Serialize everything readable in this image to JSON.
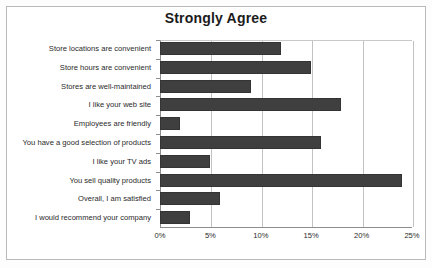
{
  "chart_data": {
    "type": "bar",
    "orientation": "horizontal",
    "title": "Strongly Agree",
    "xlabel": "",
    "ylabel": "",
    "xlim": [
      0,
      25
    ],
    "grid": true,
    "legend": false,
    "value_suffix": "%",
    "xticks": [
      "0%",
      "5%",
      "10%",
      "15%",
      "20%",
      "25%"
    ],
    "xtick_values": [
      0,
      5,
      10,
      15,
      20,
      25
    ],
    "categories": [
      "Store locations are convenient",
      "Store hours are convenient",
      "Stores are well-maintained",
      "I like your web site",
      "Employees are friendly",
      "You have a good selection of products",
      "I like your TV ads",
      "You sell quality products",
      "Overall, I am satisfied",
      "I would recommend your company"
    ],
    "values": [
      12,
      15,
      9,
      18,
      2,
      16,
      5,
      24,
      6,
      3
    ],
    "series": [
      {
        "name": "Strongly Agree",
        "values": [
          12,
          15,
          9,
          18,
          2,
          16,
          5,
          24,
          6,
          3
        ]
      }
    ],
    "colors": {
      "bar": "#3f3f3f",
      "bar_border": "#343434",
      "gridline": "#c2c2c2",
      "axis": "#8d8d8d",
      "text": "#2a2a2a",
      "background": "#ffffff",
      "frame_border": "#b9b9b9"
    }
  }
}
